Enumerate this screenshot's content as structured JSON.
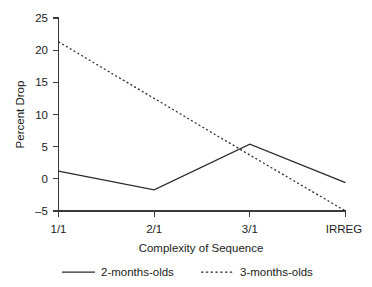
{
  "chart_data": {
    "type": "line",
    "title": "",
    "xlabel": "Complexity of Sequence",
    "ylabel": "Percent Drop",
    "categories": [
      "1/1",
      "2/1",
      "3/1",
      "IRREG"
    ],
    "ylim": [
      -5,
      25
    ],
    "yticks": [
      -5,
      0,
      5,
      10,
      15,
      20,
      25
    ],
    "ytick_labels": [
      "–5",
      "0",
      "5",
      "10",
      "15",
      "20",
      "25"
    ],
    "grid": false,
    "legend_position": "bottom",
    "series": [
      {
        "name": "2-months-olds",
        "style": "solid",
        "color": "#2a2a2a",
        "values": [
          1.2,
          -1.7,
          5.4,
          -0.6
        ]
      },
      {
        "name": "3-months-olds",
        "style": "dotted",
        "color": "#2a2a2a",
        "values": [
          21.3,
          12.5,
          3.7,
          -5.0
        ]
      }
    ]
  },
  "axis": {
    "y_title": "Percent Drop",
    "x_title": "Complexity of Sequence",
    "y_tick_0": "25",
    "y_tick_1": "20",
    "y_tick_2": "15",
    "y_tick_3": "10",
    "y_tick_4": "5",
    "y_tick_5": "0",
    "y_tick_6": "–5",
    "x_tick_0": "1/1",
    "x_tick_1": "2/1",
    "x_tick_2": "3/1",
    "x_tick_3": "IRREG"
  },
  "legend": {
    "entry_0_label": "2-months-olds",
    "entry_1_label": "3-months-olds"
  }
}
